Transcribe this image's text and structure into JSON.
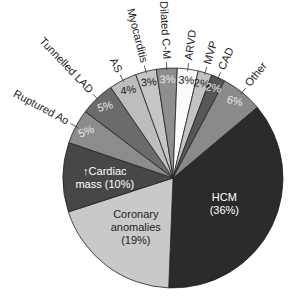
{
  "chart_data": {
    "type": "pie",
    "title": "",
    "start_angle_deg": 50,
    "direction": "clockwise",
    "center": [
      173,
      178
    ],
    "radius": 110,
    "slices": [
      {
        "label": "HCM",
        "value": 36,
        "display": "HCM\n(36%)",
        "color": "#2b2b2b",
        "text_color": "#ffffff",
        "label_position": "inside"
      },
      {
        "label": "Coronary anomalies",
        "value": 19,
        "display": "Coronary\nanomalies\n(19%)",
        "color": "#c9c9c9",
        "text_color": "#222222",
        "label_position": "inside"
      },
      {
        "label": "Cardiac mass",
        "value": 10,
        "display": "↑Cardiac\nmass (10%)",
        "color": "#474747",
        "text_color": "#ffffff",
        "label_position": "inside"
      },
      {
        "label": "Ruptured Ao",
        "value": 5,
        "display": "5%",
        "color": "#8c8c8c",
        "text_color": "#e8e8e8",
        "label_position": "outside"
      },
      {
        "label": "Tunnelled LAD",
        "value": 5,
        "display": "5%",
        "color": "#6b6b6b",
        "text_color": "#e8e8e8",
        "label_position": "outside"
      },
      {
        "label": "AS",
        "value": 4,
        "display": "4%",
        "color": "#bdbdbd",
        "text_color": "#222222",
        "label_position": "outside"
      },
      {
        "label": "Myocarditis",
        "value": 3,
        "display": "3%",
        "color": "#c6c6c6",
        "text_color": "#222222",
        "label_position": "outside"
      },
      {
        "label": "Dilated C-M",
        "value": 3,
        "display": "3%",
        "color": "#8e8e8e",
        "text_color": "#e8e8e8",
        "label_position": "outside"
      },
      {
        "label": "ARVD",
        "value": 3,
        "display": "3%",
        "color": "#fbfbfb",
        "text_color": "#222222",
        "label_position": "outside"
      },
      {
        "label": "MVP",
        "value": 2,
        "display": "2%",
        "color": "#c2c2c2",
        "text_color": "#222222",
        "label_position": "outside"
      },
      {
        "label": "CAD",
        "value": 2,
        "display": "2%",
        "color": "#575757",
        "text_color": "#e8e8e8",
        "label_position": "outside"
      },
      {
        "label": "Other",
        "value": 6,
        "display": "6%",
        "color": "#8a8a8a",
        "text_color": "#e8e8e8",
        "label_position": "outside"
      }
    ]
  }
}
